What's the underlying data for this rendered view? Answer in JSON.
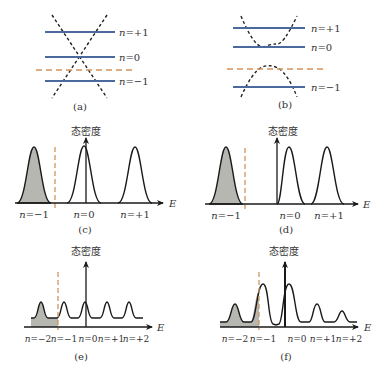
{
  "colors": {
    "level_line": "#4a6a9e",
    "fermi_dashed": "#d4935a",
    "dispersion_dashed": "#222222",
    "curve": "#1a1a1a",
    "fill": "#b7b7b2",
    "text": "#333333"
  },
  "panels": {
    "a": {
      "caption": "(a)",
      "levels": [
        {
          "label": "n=+1",
          "n": "n",
          "rest": "=+1"
        },
        {
          "label": "n=0",
          "n": "n",
          "rest": "=0"
        },
        {
          "label": "n=−1",
          "n": "n",
          "rest": "=−1"
        }
      ],
      "dispersion": "linear (Dirac cone) crossing at n=0",
      "fermi_level": "between n=0 and n=−1"
    },
    "b": {
      "caption": "(b)",
      "levels": [
        {
          "label": "n=+1",
          "n": "n",
          "rest": "=+1"
        },
        {
          "label": "n=0",
          "n": "n",
          "rest": "=0"
        },
        {
          "label": "n=−1",
          "n": "n",
          "rest": "=−1"
        }
      ],
      "dispersion": "gapped parabolic bands",
      "fermi_level": "between n=0 and n=−1, near valence band top"
    },
    "c": {
      "caption": "(c)",
      "y_axis_label": "态密度",
      "x_axis_label": "E",
      "peak_labels": [
        {
          "n": "n",
          "rest": "=−1"
        },
        {
          "n": "n",
          "rest": "=0"
        },
        {
          "n": "n",
          "rest": "=+1"
        }
      ]
    },
    "d": {
      "caption": "(d)",
      "y_axis_label": "态密度",
      "x_axis_label": "E",
      "peak_labels": [
        {
          "n": "n",
          "rest": "=−1"
        },
        {
          "n": "n",
          "rest": "=0"
        },
        {
          "n": "n",
          "rest": "=+1"
        }
      ]
    },
    "e": {
      "caption": "(e)",
      "y_axis_label": "态密度",
      "x_axis_label": "E",
      "peak_labels": [
        {
          "n": "n",
          "rest": "=−2"
        },
        {
          "n": "n",
          "rest": "=−1"
        },
        {
          "n": "n",
          "rest": "=0"
        },
        {
          "n": "n",
          "rest": "=+1"
        },
        {
          "n": "n",
          "rest": "=+2"
        }
      ]
    },
    "f": {
      "caption": "(f)",
      "y_axis_label": "态密度",
      "x_axis_label": "E",
      "peak_labels": [
        {
          "n": "n",
          "rest": "=−2"
        },
        {
          "n": "n",
          "rest": "=−1"
        },
        {
          "n": "n",
          "rest": "=0"
        },
        {
          "n": "n",
          "rest": "=+1"
        },
        {
          "n": "n",
          "rest": "=+2"
        }
      ]
    }
  }
}
